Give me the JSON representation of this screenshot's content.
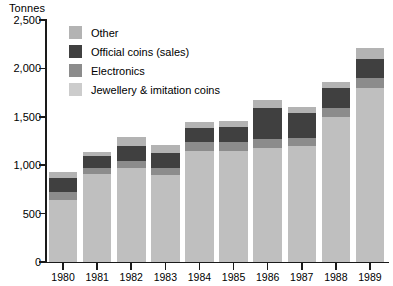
{
  "chart_data": {
    "type": "bar",
    "stacked": true,
    "title": "Tonnes",
    "xlabel": "",
    "ylabel": "Tonnes",
    "ylim": [
      0,
      2500
    ],
    "yticks": [
      0,
      500,
      1000,
      1500,
      2000,
      2500
    ],
    "ytick_labels": [
      "0",
      "500",
      "1,000",
      "1,500",
      "2,000",
      "2,500"
    ],
    "grid": false,
    "legend_position": "top-left",
    "categories": [
      "1980",
      "1981",
      "1982",
      "1983",
      "1984",
      "1985",
      "1986",
      "1987",
      "1988",
      "1989"
    ],
    "series": [
      {
        "name": "Jewellery & imitation coins",
        "color": "#bfbfbf",
        "values": [
          640,
          905,
          975,
          900,
          1150,
          1150,
          1180,
          1195,
          1500,
          1800
        ]
      },
      {
        "name": "Electronics",
        "color": "#8c8c8c",
        "values": [
          85,
          65,
          70,
          75,
          85,
          85,
          95,
          90,
          95,
          100
        ]
      },
      {
        "name": "Official coins (sales)",
        "color": "#404040",
        "values": [
          145,
          125,
          150,
          155,
          150,
          155,
          320,
          250,
          200,
          200
        ]
      },
      {
        "name": "Other",
        "color": "#b3b3b3",
        "values": [
          60,
          45,
          95,
          80,
          65,
          70,
          75,
          70,
          65,
          110
        ]
      }
    ],
    "totals": [
      930,
      1140,
      1290,
      1210,
      1450,
      1460,
      1670,
      1605,
      1860,
      2210
    ],
    "legend_order": [
      "Other",
      "Official coins (sales)",
      "Electronics",
      "Jewellery & imitation coins"
    ]
  },
  "legend": {
    "items": [
      {
        "label": "Other",
        "color": "#b3b3b3"
      },
      {
        "label": "Official coins (sales)",
        "color": "#404040"
      },
      {
        "label": "Electronics",
        "color": "#8c8c8c"
      },
      {
        "label": "Jewellery & imitation coins",
        "color": "#cccccc"
      }
    ]
  }
}
